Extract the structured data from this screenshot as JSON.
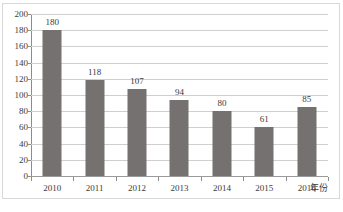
{
  "chart_data": {
    "type": "bar",
    "title": "",
    "subtitle": "",
    "categories": [
      "2010",
      "2011",
      "2012",
      "2013",
      "2014",
      "2015",
      "2016"
    ],
    "values": [
      180,
      118,
      107,
      94,
      80,
      61,
      85
    ],
    "data_labels": [
      "180",
      "118",
      "107",
      "94",
      "80",
      "61",
      "85"
    ],
    "xlabel": "年份",
    "ylabel": "",
    "ylim": [
      0,
      200
    ],
    "ytick_step": 20,
    "ytick_labels": [
      "200",
      "180",
      "160",
      "140",
      "120",
      "100",
      "80",
      "60",
      "40",
      "20",
      "0"
    ],
    "grid": true,
    "grid_axis": "y",
    "legend": false,
    "legend_position": "none",
    "series": [
      {
        "name": "",
        "values": [
          180,
          118,
          107,
          94,
          80,
          61,
          85
        ]
      }
    ],
    "colors": {
      "bar": "#767171",
      "gridline": "#cfcfcf",
      "axis": "#8c8c8c",
      "text": "#3a3a3a",
      "frame": "#d8d8d8",
      "background": "#ffffff"
    }
  }
}
